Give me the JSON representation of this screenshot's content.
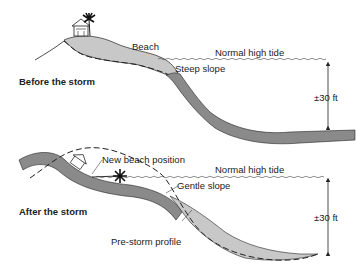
{
  "panels": {
    "before": {
      "title": "Before the storm",
      "labels": {
        "beach": "Beach",
        "tide": "Normal high tide",
        "slope": "Steep slope",
        "depth": "±30 ft"
      }
    },
    "after": {
      "title": "After the storm",
      "labels": {
        "new_beach": "New beach position",
        "tide": "Normal high tide",
        "slope": "Gentle slope",
        "pre_storm": "Pre-storm profile",
        "depth": "±30 ft"
      }
    }
  },
  "colors": {
    "sand_light": "#c8c8c8",
    "sand_dark": "#8a8a8a",
    "line": "#222222",
    "background": "#ffffff"
  }
}
